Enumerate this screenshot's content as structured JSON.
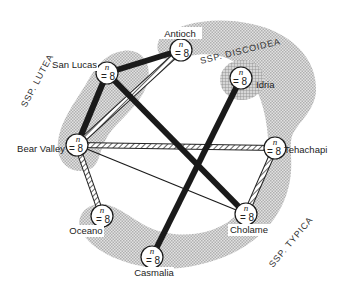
{
  "diagram": {
    "regions": [
      {
        "id": "lutea",
        "label": "SSP. LUTEA"
      },
      {
        "id": "discoidea",
        "label": "SSP. DISCOIDEA"
      },
      {
        "id": "typica",
        "label": "SSP. TYPICA"
      }
    ],
    "nodes": [
      {
        "id": "antioch",
        "label": "Antioch",
        "n_label": "n",
        "count_label": "= 8",
        "x": 181,
        "y": 50
      },
      {
        "id": "san-lucas",
        "label": "San Lucas",
        "n_label": "n",
        "count_label": "= 8",
        "x": 107,
        "y": 73
      },
      {
        "id": "idria",
        "label": "Idria",
        "n_label": "n",
        "count_label": "= 8",
        "x": 241,
        "y": 78
      },
      {
        "id": "bear-valley",
        "label": "Bear Valley",
        "n_label": "n",
        "count_label": "= 8",
        "x": 77,
        "y": 145
      },
      {
        "id": "tehachapi",
        "label": "Tehachapi",
        "n_label": "n",
        "count_label": "= 8",
        "x": 275,
        "y": 148
      },
      {
        "id": "oceano",
        "label": "Oceano",
        "n_label": "n",
        "count_label": "= 8",
        "x": 102,
        "y": 216
      },
      {
        "id": "cholame",
        "label": "Cholame",
        "n_label": "n",
        "count_label": "= 8",
        "x": 246,
        "y": 214
      },
      {
        "id": "casmalia",
        "label": "Casmalia",
        "n_label": "n",
        "count_label": "= 8",
        "x": 152,
        "y": 257
      }
    ],
    "edges": [
      {
        "from": "san-lucas",
        "to": "antioch",
        "style": "thick"
      },
      {
        "from": "san-lucas",
        "to": "bear-valley",
        "style": "thick"
      },
      {
        "from": "san-lucas",
        "to": "cholame",
        "style": "thick"
      },
      {
        "from": "idria",
        "to": "casmalia",
        "style": "thick"
      },
      {
        "from": "antioch",
        "to": "bear-valley",
        "style": "hatched"
      },
      {
        "from": "bear-valley",
        "to": "tehachapi",
        "style": "hatched"
      },
      {
        "from": "bear-valley",
        "to": "oceano",
        "style": "hatched"
      },
      {
        "from": "tehachapi",
        "to": "cholame",
        "style": "hatched"
      },
      {
        "from": "bear-valley",
        "to": "cholame",
        "style": "thin"
      }
    ],
    "colors": {
      "region_fill": "#c8c8c8",
      "discoidea_fill": "#a8a8a8",
      "edge": "#1a1a1a",
      "node_fill": "#ffffff"
    }
  }
}
